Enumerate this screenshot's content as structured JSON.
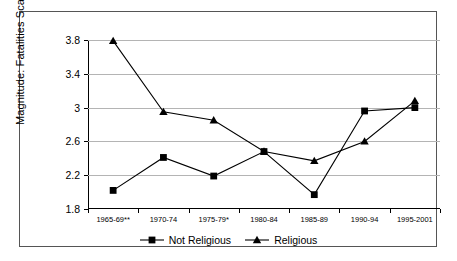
{
  "chart_data": {
    "type": "line",
    "title": "",
    "xlabel": "",
    "ylabel": "Magnitude: Fatalities Scale",
    "ylim": [
      1.8,
      3.8
    ],
    "yticks": [
      "1.8",
      "2.2",
      "2.6",
      "3",
      "3.4",
      "3.8"
    ],
    "ytick_values": [
      1.8,
      2.2,
      2.6,
      3.0,
      3.4,
      3.8
    ],
    "grid": true,
    "legend_position": "bottom",
    "categories": [
      "1965-69**",
      "1970-74",
      "1975-79*",
      "1980-84",
      "1985-89",
      "1990-94",
      "1995-2001"
    ],
    "series": [
      {
        "name": "Not Religious",
        "marker": "square",
        "values": [
          2.02,
          2.41,
          2.19,
          2.48,
          1.97,
          2.96,
          3.0
        ]
      },
      {
        "name": "Religious",
        "marker": "triangle",
        "values": [
          3.79,
          2.95,
          2.85,
          2.48,
          2.37,
          2.6,
          3.08
        ]
      }
    ]
  },
  "colors": {
    "line": "#000000",
    "grid": "#b4b4b4",
    "axis": "#000000",
    "frame": "#555555",
    "background": "#ffffff"
  }
}
